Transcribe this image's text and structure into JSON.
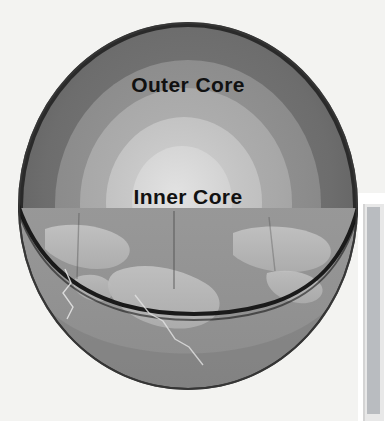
{
  "page": {
    "background_color": "#f3f3f1",
    "width": 385,
    "height": 421
  },
  "figure": {
    "name": "earth-interior-cutaway",
    "labels": {
      "outer_core": "Outer Core",
      "inner_core": "Inner Core"
    },
    "layers": [
      {
        "name": "crust",
        "fill": "#1c1c1c",
        "radius_pct": 100
      },
      {
        "name": "mantle",
        "fill": "#6e6e6e",
        "radius_pct": 97
      },
      {
        "name": "outer-core",
        "fill": "#8e8e8e",
        "radius_pct": 78
      },
      {
        "name": "transition",
        "fill": "#a9a9a9",
        "radius_pct": 62
      },
      {
        "name": "inner-core",
        "fill": "#c2c2c2",
        "radius_pct": 46
      },
      {
        "name": "inner-center",
        "fill": "#d6d6d6",
        "radius_pct": 30
      }
    ],
    "surface": {
      "ocean_fill": "#989898",
      "land_fill": "#b5b5b5",
      "crack_color": "#e6e6e6"
    },
    "cut_plane_y_pct": 51
  },
  "scrollbar": {
    "name": "vertical-scrollbar",
    "track_color": "#e8e8e8",
    "thumb_color": "#b9bcc0"
  }
}
